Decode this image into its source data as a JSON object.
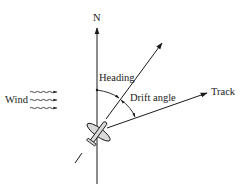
{
  "diagram": {
    "type": "wind-drift-navigation",
    "labels": {
      "north": "N",
      "heading": "Heading",
      "drift_angle": "Drift angle",
      "track": "Track",
      "wind": "Wind"
    },
    "colors": {
      "ink": "#1a1a1a",
      "plane_fill": "#d9d9d9",
      "background": "#ffffff"
    }
  }
}
